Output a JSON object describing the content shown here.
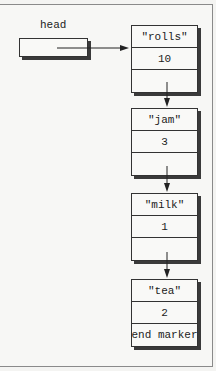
{
  "diagram": {
    "type": "linked-list",
    "head": {
      "label": "head"
    },
    "nodes": [
      {
        "name": "\"rolls\"",
        "quantity": "10",
        "next": ""
      },
      {
        "name": "\"jam\"",
        "quantity": "3",
        "next": ""
      },
      {
        "name": "\"milk\"",
        "quantity": "1",
        "next": ""
      },
      {
        "name": "\"tea\"",
        "quantity": "2",
        "next": "end marker"
      }
    ],
    "colors": {
      "background": "#f4f4f2",
      "line": "#333333",
      "shadow": "#3a3a3a",
      "frame": "#8a8a8a"
    }
  }
}
